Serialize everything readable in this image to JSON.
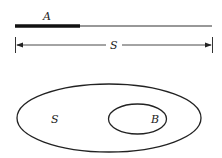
{
  "segment_diagram": {
    "subset_label": "A",
    "whole_label": "S"
  },
  "venn_diagram": {
    "outer_label": "S",
    "inner_label": "B"
  },
  "colors": {
    "stroke": "#222222",
    "background": "#ffffff"
  }
}
